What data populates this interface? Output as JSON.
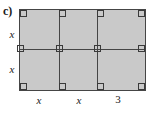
{
  "figure": {
    "part_label": "c)",
    "type": "geometry-diagram",
    "fill_color": "#c9c9c9",
    "line_color": "#454545",
    "background_color": "#ffffff"
  },
  "grid": {
    "columns": 3,
    "rows": 2,
    "column_widths": [
      "x",
      "x",
      "3"
    ],
    "row_heights": [
      "x",
      "x"
    ],
    "cells": [
      {
        "row": 0,
        "col": 0,
        "width": "x",
        "height": "x"
      },
      {
        "row": 0,
        "col": 1,
        "width": "x",
        "height": "x"
      },
      {
        "row": 0,
        "col": 2,
        "width": "3",
        "height": "x"
      },
      {
        "row": 1,
        "col": 0,
        "width": "x",
        "height": "x"
      },
      {
        "row": 1,
        "col": 1,
        "width": "x",
        "height": "x"
      },
      {
        "row": 1,
        "col": 2,
        "width": "3",
        "height": "x"
      }
    ]
  },
  "labels": {
    "left": [
      "x",
      "x"
    ],
    "bottom": [
      "x",
      "x",
      "3"
    ]
  },
  "angle_marks": {
    "count": 12,
    "symbol": "right-angle-square"
  }
}
